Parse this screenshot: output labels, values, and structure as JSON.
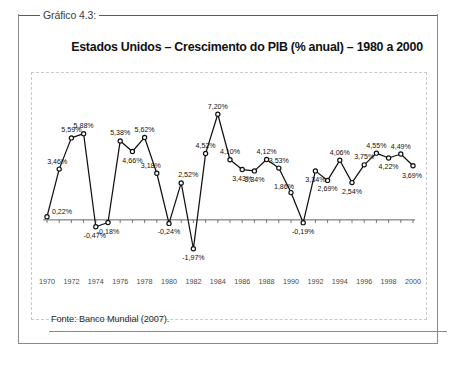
{
  "caption": "Gráfico 4.3:",
  "title": "Estados Unidos – Crescimento do PIB (% anual) – 1980 a 2000",
  "source": "Fonte: Banco Mundial (2007).",
  "chart_data": {
    "type": "line",
    "title": "Estados Unidos – Crescimento do PIB (% anual) – 1980 a 2000",
    "xlabel": "",
    "ylabel": "",
    "grid": false,
    "legend": "none",
    "ylim": [
      -2.6,
      7.9
    ],
    "xlim": [
      1970,
      2000
    ],
    "xtick_labels": [
      "1970",
      "1972",
      "1974",
      "1976",
      "1978",
      "1980",
      "1982",
      "1984",
      "1986",
      "1988",
      "1990",
      "1992",
      "1994",
      "1996",
      "1998",
      "2000"
    ],
    "x": [
      1970,
      1971,
      1972,
      1973,
      1974,
      1975,
      1976,
      1977,
      1978,
      1979,
      1980,
      1981,
      1982,
      1983,
      1984,
      1985,
      1986,
      1987,
      1988,
      1989,
      1990,
      1991,
      1992,
      1993,
      1994,
      1995,
      1996,
      1997,
      1998,
      1999,
      2000
    ],
    "values": [
      0.22,
      3.46,
      5.59,
      5.88,
      -0.47,
      -0.18,
      5.38,
      4.66,
      5.62,
      3.18,
      -0.24,
      2.52,
      -1.97,
      4.52,
      7.2,
      4.1,
      3.43,
      3.34,
      4.12,
      3.53,
      1.86,
      -0.19,
      3.34,
      2.69,
      4.06,
      2.54,
      3.75,
      4.55,
      4.22,
      4.49,
      3.69
    ],
    "point_labels": [
      "0,22%",
      "3,46%",
      "5,59%",
      "5,88%",
      "-0,47%",
      "-0,18%",
      "5,38%",
      "4,66%",
      "5,62%",
      "3,18%",
      "-0,24%",
      "2,52%",
      "-1,97%",
      "4,52%",
      "7,20%",
      "4,10%",
      "3,43%",
      "3,34%",
      "4,12%",
      "3,53%",
      "1,86%",
      "-0,19%",
      "3,34%",
      "2,69%",
      "4,06%",
      "2,54%",
      "3,75%",
      "4,55%",
      "4,22%",
      "4,49%",
      "3,69%"
    ],
    "series_color": "#111111",
    "marker": "circle"
  }
}
